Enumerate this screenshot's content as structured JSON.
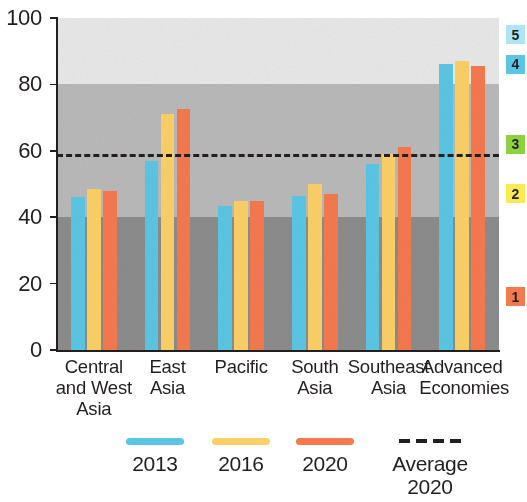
{
  "chart_data": {
    "type": "bar",
    "title": "",
    "subtitle": "",
    "xlabel": "",
    "ylabel": "",
    "ylim": [
      0,
      100
    ],
    "yticks": [
      0,
      20,
      40,
      60,
      80,
      100
    ],
    "ytick_labels": [
      "0",
      "20",
      "40",
      "60",
      "80",
      "100"
    ],
    "grid": false,
    "legend_position": "bottom",
    "categories": [
      "Central\nand West\nAsia",
      "East\nAsia",
      "Pacific",
      "South\nAsia",
      "Southeast\nAsia",
      "Advanced\nEconomies"
    ],
    "series": [
      {
        "name": "2013",
        "color": "#5BC6E4",
        "values": [
          46,
          57,
          43.5,
          46.5,
          56,
          86
        ]
      },
      {
        "name": "2016",
        "color": "#FBD066",
        "values": [
          48.5,
          71,
          45,
          50,
          59,
          87
        ]
      },
      {
        "name": "2020",
        "color": "#F4794F",
        "values": [
          48,
          72.5,
          45,
          47,
          61,
          85.5
        ]
      }
    ],
    "reference_line": {
      "label": "Average\n2020",
      "value": 59,
      "style": "dashed",
      "color": "#231f20"
    },
    "background_bands": [
      {
        "from": 80,
        "to": 100,
        "color": "#e8e8e8"
      },
      {
        "from": 40,
        "to": 80,
        "color": "#b9b9b9"
      },
      {
        "from": 0,
        "to": 40,
        "color": "#8c8c8c"
      }
    ],
    "side_badges": [
      {
        "label": "5",
        "color": "#ADE5F4",
        "value_position": 95
      },
      {
        "label": "4",
        "color": "#5BC6E4",
        "value_position": 86
      },
      {
        "label": "3",
        "color": "#8DD13F",
        "value_position": 62
      },
      {
        "label": "2",
        "color": "#F7EB4F",
        "value_position": 47
      },
      {
        "label": "1",
        "color": "#F4794F",
        "value_position": 16
      }
    ]
  },
  "legend": {
    "items": [
      {
        "label": "2013",
        "swatch": "color",
        "color": "#5BC6E4"
      },
      {
        "label": "2016",
        "swatch": "color",
        "color": "#FBD066"
      },
      {
        "label": "2020",
        "swatch": "color",
        "color": "#F4794F"
      },
      {
        "label": "Average\n2020",
        "swatch": "dashed",
        "color": "#231f20"
      }
    ]
  },
  "axis": {
    "y_labels": [
      "100",
      "80",
      "60",
      "40",
      "20",
      "0"
    ]
  },
  "groups": [
    {
      "label": "Central\nand West\nAsia"
    },
    {
      "label": "East\nAsia"
    },
    {
      "label": "Pacific"
    },
    {
      "label": "South\nAsia"
    },
    {
      "label": "Southeast\nAsia"
    },
    {
      "label": "Advanced\nEconomies"
    }
  ]
}
